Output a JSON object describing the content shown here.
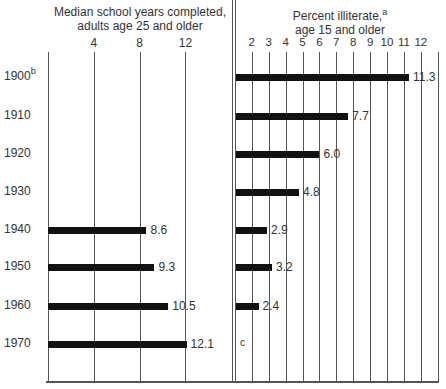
{
  "chart_data": [
    {
      "type": "bar",
      "orientation": "horizontal",
      "title": "Median school years completed, adults age 25 and older",
      "title_lines": [
        "Median school years completed,",
        "adults age 25 and older"
      ],
      "categories": [
        "1900",
        "1910",
        "1920",
        "1930",
        "1940",
        "1950",
        "1960",
        "1970"
      ],
      "values": [
        null,
        null,
        null,
        null,
        8.6,
        9.3,
        10.5,
        12.1
      ],
      "value_labels": [
        "",
        "",
        "",
        "",
        "8.6",
        "9.3",
        "10.5",
        "12.1"
      ],
      "xticks": [
        "4",
        "8",
        "12"
      ],
      "xlim": [
        0,
        16
      ],
      "grid": true
    },
    {
      "type": "bar",
      "orientation": "horizontal",
      "title": "Percent illiterate, age 15 and older",
      "title_lines": [
        "Percent illiterate,",
        "age 15 and older"
      ],
      "title_footnote": "a",
      "categories": [
        "1900",
        "1910",
        "1920",
        "1930",
        "1940",
        "1950",
        "1960",
        "1970"
      ],
      "values": [
        11.3,
        7.7,
        6.0,
        4.8,
        2.9,
        3.2,
        2.4,
        null
      ],
      "value_labels": [
        "11.3",
        "7.7",
        "6.0",
        "4.8",
        "2.9",
        "3.2",
        "2.4",
        "c"
      ],
      "xticks": [
        "2",
        "3",
        "4",
        "5",
        "6",
        "7",
        "8",
        "9",
        "10",
        "11",
        "12"
      ],
      "xlim": [
        1,
        13
      ],
      "grid": true
    }
  ],
  "left": {
    "title_line1": "Median school years completed,",
    "title_line2": "adults age 25 and older",
    "ticks": [
      "4",
      "8",
      "12"
    ]
  },
  "right": {
    "title_line1": "Percent illiterate,",
    "title_sup": "a",
    "title_line2": "age 15 and older",
    "ticks": [
      "2",
      "3",
      "4",
      "5",
      "6",
      "7",
      "8",
      "9",
      "10",
      "11",
      "12"
    ]
  },
  "years": [
    {
      "label": "1900",
      "sup": "b"
    },
    {
      "label": "1910",
      "sup": ""
    },
    {
      "label": "1920",
      "sup": ""
    },
    {
      "label": "1930",
      "sup": ""
    },
    {
      "label": "1940",
      "sup": ""
    },
    {
      "label": "1950",
      "sup": ""
    },
    {
      "label": "1960",
      "sup": ""
    },
    {
      "label": "1970",
      "sup": ""
    }
  ],
  "left_values": [
    null,
    null,
    null,
    null,
    "8.6",
    "9.3",
    "10.5",
    "12.1"
  ],
  "right_values": [
    "11.3",
    "7.7",
    "6.0",
    "4.8",
    "2.9",
    "3.2",
    "2.4",
    "c"
  ]
}
